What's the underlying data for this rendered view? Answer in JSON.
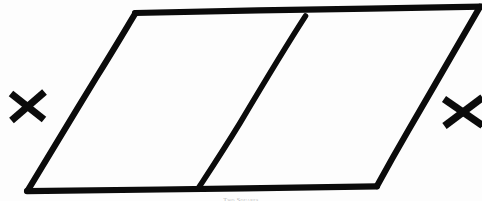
{
  "figure": {
    "title": "Two Squares",
    "caption": "Two Squares",
    "ink_color": "#0b0b0b",
    "background_color": "#fdfdfd",
    "caption_color": "#9a9a9a",
    "width": 482,
    "height": 201
  },
  "shape": {
    "name": "divided-parallelogram",
    "outline_label": "parallelogram-outline",
    "divider_label": "middle-divider",
    "cell_left_label": "left-rhombus",
    "cell_right_label": "right-rhombus",
    "vertices": {
      "top_left": [
        135,
        13
      ],
      "top_right": [
        478,
        7
      ],
      "bottom_right": [
        377,
        186
      ],
      "bottom_left": [
        27,
        191
      ]
    },
    "divider": {
      "top": [
        305,
        16
      ],
      "bottom": [
        198,
        188
      ]
    },
    "outline_path": "M 135 13 L 478 7 M 478 7 L 377 186 M 377 186 L 27 191 M 27 191 L 135 13",
    "divider_path": "M 305 16 L 198 188"
  },
  "marks": {
    "left_x": {
      "label": "X",
      "center": [
        27,
        106
      ],
      "stroke_a": "M 11 93 L 44 120",
      "stroke_b": "M 44 92 L 11 120"
    },
    "right_x": {
      "label": "X",
      "center": [
        462,
        112
      ],
      "stroke_a": "M 444 99 L 481 125",
      "stroke_b": "M 481 98 L 444 126"
    }
  }
}
